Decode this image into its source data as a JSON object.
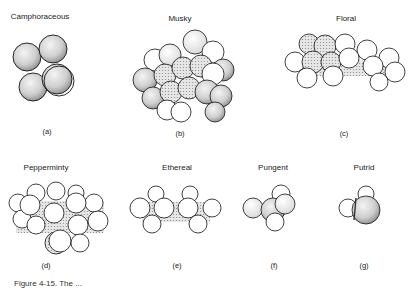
{
  "figure": {
    "panels": [
      {
        "id": "a",
        "odor": "Camphoraceous",
        "label": "(a)"
      },
      {
        "id": "b",
        "odor": "Musky",
        "label": "(b)"
      },
      {
        "id": "c",
        "odor": "Floral",
        "label": "(c)"
      },
      {
        "id": "d",
        "odor": "Pepperminty",
        "label": "(d)"
      },
      {
        "id": "e",
        "odor": "Ethereal",
        "label": "(e)"
      },
      {
        "id": "f",
        "odor": "Pungent",
        "label": "(f)"
      },
      {
        "id": "g",
        "odor": "Putrid",
        "label": "(g)"
      }
    ],
    "caption": "Figure 4-15. The ..."
  }
}
